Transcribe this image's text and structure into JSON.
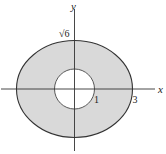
{
  "diagram": {
    "colors": {
      "region_fill": "#d9d9d9",
      "stroke": "#333333",
      "background": "#ffffff"
    },
    "axes": {
      "x_label": "x",
      "y_label": "y"
    },
    "labels": {
      "inner_radius": "1",
      "outer_x_intercept": "3",
      "outer_y_intercept": "√6"
    },
    "shapes": {
      "outer_ellipse": {
        "a": 3,
        "b": "√6"
      },
      "inner_circle": {
        "r": 1
      }
    }
  }
}
